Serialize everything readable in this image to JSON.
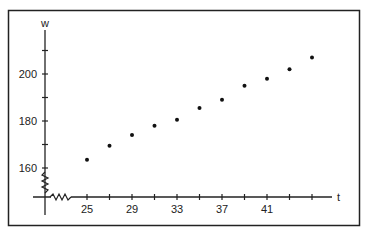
{
  "chart_data": {
    "type": "scatter",
    "title": "",
    "xlabel": "t",
    "ylabel": "w",
    "x_tick_labels": [
      "25",
      "29",
      "33",
      "37",
      "41"
    ],
    "x_ticks": [
      25,
      27,
      29,
      31,
      33,
      35,
      37,
      39,
      41,
      43,
      45
    ],
    "y_tick_labels": [
      "160",
      "180",
      "200"
    ],
    "y_ticks": [
      160,
      170,
      180,
      190,
      200,
      210
    ],
    "xlim": [
      19,
      47
    ],
    "ylim": [
      148,
      214
    ],
    "axis_breaks": {
      "x": true,
      "y": true
    },
    "grid": false,
    "legend": null,
    "x": [
      25,
      27,
      29,
      31,
      33,
      35,
      37,
      39,
      41,
      43,
      45
    ],
    "y": [
      163.5,
      169.5,
      174,
      178,
      180.5,
      185.5,
      189,
      195,
      198,
      202,
      207
    ],
    "marker_color": "#111111"
  },
  "frame": {
    "border_color": "#222222"
  }
}
